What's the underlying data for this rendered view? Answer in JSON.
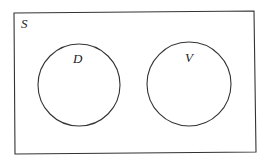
{
  "diagram": {
    "type": "venn",
    "universe": {
      "label": "S"
    },
    "sets": [
      {
        "label": "D"
      },
      {
        "label": "V"
      }
    ],
    "colors": {
      "stroke": "#333333",
      "background": "#ffffff"
    }
  }
}
